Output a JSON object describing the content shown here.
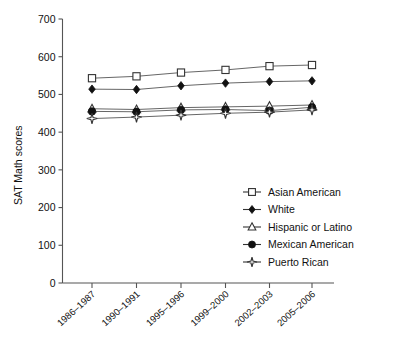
{
  "chart_data": {
    "type": "line",
    "title": "",
    "xlabel": "",
    "ylabel": "SAT Math scores",
    "ylim": [
      0,
      700
    ],
    "ytick_step": 100,
    "yticks": [
      "0",
      "100",
      "200",
      "300",
      "400",
      "500",
      "600",
      "700"
    ],
    "grid": false,
    "legend_position": "right-middle",
    "categories": [
      "1986–1987",
      "1990–1991",
      "1995–1996",
      "1999–2000",
      "2002–2003",
      "2005–2006"
    ],
    "series": [
      {
        "name": "Asian American",
        "marker": "open-square",
        "values": [
          543,
          548,
          558,
          565,
          575,
          578
        ]
      },
      {
        "name": "White",
        "marker": "filled-diamond",
        "values": [
          514,
          513,
          523,
          530,
          534,
          536
        ]
      },
      {
        "name": "Hispanic or Latino",
        "marker": "open-triangle",
        "values": [
          462,
          460,
          465,
          467,
          469,
          472
        ]
      },
      {
        "name": "Mexican American",
        "marker": "filled-circle",
        "values": [
          455,
          454,
          459,
          460,
          457,
          466
        ]
      },
      {
        "name": "Puerto Rican",
        "marker": "open-star",
        "values": [
          436,
          440,
          445,
          450,
          453,
          459
        ]
      }
    ]
  },
  "axis": {
    "y_label": "SAT Math scores"
  },
  "legend": {
    "items": [
      {
        "label": "Asian American"
      },
      {
        "label": "White"
      },
      {
        "label": "Hispanic or Latino"
      },
      {
        "label": "Mexican American"
      },
      {
        "label": "Puerto Rican"
      }
    ]
  },
  "colors": {
    "axis": "#555555",
    "line": "#555555",
    "marker_fill": "#111111",
    "marker_open": "#ffffff",
    "text": "#111111",
    "background": "#ffffff"
  }
}
